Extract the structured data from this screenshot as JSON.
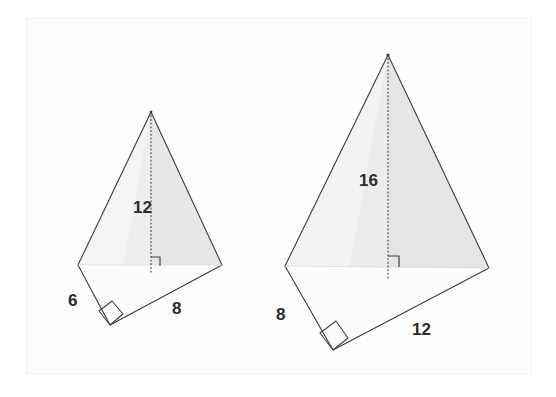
{
  "page": {
    "background_color": "#ffffff",
    "frame": {
      "present": true,
      "color": "#f2f2f2",
      "x": 26,
      "y": 18,
      "width": 506,
      "height": 356
    }
  },
  "style": {
    "outline_color": "#3a3a3a",
    "outline_width": 1.1,
    "face_fill_light": "#fbfbfb",
    "face_fill_mid": "#ededed",
    "face_fill_shaded": "#e3e3e3",
    "altitude_color": "#555555",
    "altitude_dash": "1,2.6",
    "label_color": "#2b2b2b",
    "label_font_size": 17,
    "right_angle_color": "#3a3a3a"
  },
  "figures": [
    {
      "id": "left-pyramid",
      "name": "left-figure",
      "vertices": {
        "apex": {
          "x": 151,
          "y": 112
        },
        "left": {
          "x": 78,
          "y": 265
        },
        "bottom": {
          "x": 110,
          "y": 325
        },
        "right": {
          "x": 222,
          "y": 265
        }
      },
      "altitude": {
        "from": {
          "x": 151,
          "y": 112
        },
        "to": {
          "x": 151,
          "y": 268
        },
        "label": "12"
      },
      "label_positions": {
        "altitude": {
          "x": 133,
          "y": 212
        },
        "left_edge": {
          "x": 71,
          "y": 305
        },
        "bottom_edge": {
          "x": 175,
          "y": 313
        }
      },
      "right_angles": [
        {
          "at": "altitude-foot",
          "x": 151,
          "y": 268,
          "size": 9,
          "orientation": "up-right"
        },
        {
          "at": "bottom-vertex",
          "x": 110,
          "y": 325,
          "size": 14,
          "orientation": "corner"
        }
      ],
      "measurements": [
        {
          "name": "altitude",
          "value": "12"
        },
        {
          "name": "left-base-edge",
          "value": "6"
        },
        {
          "name": "right-base-edge",
          "value": "8"
        }
      ]
    },
    {
      "id": "right-pyramid",
      "name": "right-figure",
      "vertices": {
        "apex": {
          "x": 388,
          "y": 55
        },
        "left": {
          "x": 285,
          "y": 266
        },
        "bottom": {
          "x": 333,
          "y": 350
        },
        "right": {
          "x": 489,
          "y": 268
        }
      },
      "altitude": {
        "from": {
          "x": 388,
          "y": 55
        },
        "to": {
          "x": 388,
          "y": 276
        },
        "label": "16"
      },
      "label_positions": {
        "altitude": {
          "x": 363,
          "y": 184
        },
        "left_edge": {
          "x": 280,
          "y": 318
        },
        "bottom_edge": {
          "x": 417,
          "y": 333
        }
      },
      "right_angles": [
        {
          "at": "altitude-foot",
          "x": 388,
          "y": 266,
          "size": 10,
          "orientation": "up-right"
        },
        {
          "at": "bottom-vertex",
          "x": 333,
          "y": 350,
          "size": 16,
          "orientation": "corner"
        }
      ],
      "measurements": [
        {
          "name": "altitude",
          "value": "16"
        },
        {
          "name": "left-base-edge",
          "value": "8"
        },
        {
          "name": "right-base-edge",
          "value": "12"
        }
      ]
    }
  ],
  "labels": {
    "left_altitude": "12",
    "left_base_left": "6",
    "left_base_right": "8",
    "right_altitude": "16",
    "right_base_left": "8",
    "right_base_right": "12"
  }
}
